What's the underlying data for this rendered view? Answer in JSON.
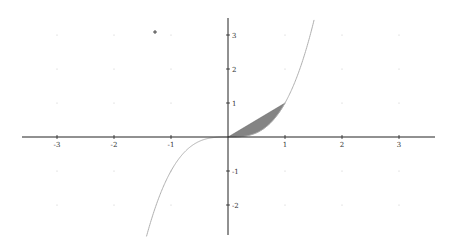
{
  "chart_data": {
    "type": "line",
    "title": "",
    "xlabel": "",
    "ylabel": "",
    "xlim": [
      -4,
      3.6
    ],
    "ylim": [
      -2.9,
      3.5
    ],
    "grid": "dots",
    "x_ticks": [
      -3,
      -2,
      -1,
      1,
      2,
      3
    ],
    "y_ticks": [
      -2,
      -1,
      1,
      2,
      3
    ],
    "x_tick_labels": [
      "-3",
      "-2",
      "-1",
      "1",
      "2",
      "3"
    ],
    "y_tick_labels": [
      "-2",
      "-1",
      "1",
      "2",
      "3"
    ],
    "series": [
      {
        "name": "f(x) = x^3",
        "type": "curve",
        "color": "#b0b0b0",
        "x": [
          -1.43,
          -1.2,
          -1.0,
          -0.8,
          -0.6,
          -0.4,
          -0.2,
          0,
          0.2,
          0.4,
          0.6,
          0.8,
          1.0,
          1.2,
          1.4,
          1.52
        ],
        "y": [
          -2.92,
          -1.73,
          -1.0,
          -0.51,
          -0.22,
          -0.06,
          -0.01,
          0,
          0.01,
          0.06,
          0.22,
          0.51,
          1.0,
          1.73,
          2.74,
          3.5
        ]
      },
      {
        "name": "shaded region between y = x and y = x^3 on [0, 1]",
        "type": "area",
        "color": "#6e6e6e",
        "x_range": [
          0,
          1
        ],
        "upper": "x",
        "lower": "x^3"
      }
    ],
    "annotations": [
      {
        "type": "point-marker",
        "x": -1.3,
        "y": 3.1
      }
    ]
  },
  "colors": {
    "axis": "#222222",
    "curve": "#b0b0b0",
    "fill": "#6e6e6e",
    "grid_dot": "#c8c8c8"
  }
}
